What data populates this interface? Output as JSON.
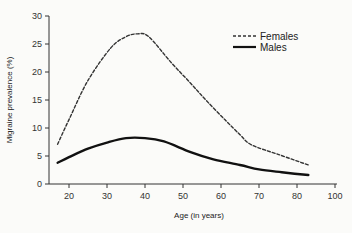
{
  "chart_data": {
    "type": "line",
    "title": "",
    "xlabel": "Age (in years)",
    "ylabel": "Migraine prevalence (%)",
    "xlim": [
      15,
      92
    ],
    "ylim": [
      0,
      30
    ],
    "grid": false,
    "legend_position": "upper right",
    "x_ticks": [
      {
        "pos": 20,
        "label": "20"
      },
      {
        "pos": 30,
        "label": "30"
      },
      {
        "pos": 40,
        "label": "40"
      },
      {
        "pos": 50,
        "label": "50"
      },
      {
        "pos": 60,
        "label": "60"
      },
      {
        "pos": 70,
        "label": "70"
      },
      {
        "pos": 80,
        "label": "80"
      },
      {
        "pos": 90,
        "label": "100"
      }
    ],
    "y_ticks": [
      0,
      5,
      10,
      15,
      20,
      25,
      30
    ],
    "series": [
      {
        "name": "Females",
        "style": "dashed",
        "color": "#333333",
        "x": [
          17,
          20,
          25,
          31,
          35,
          38,
          41,
          47,
          52,
          56,
          61,
          65,
          68,
          75,
          83
        ],
        "values": [
          7.1,
          11.5,
          18.5,
          24.3,
          26.3,
          26.8,
          26.3,
          21.6,
          18.0,
          15.0,
          11.5,
          8.8,
          7.0,
          5.3,
          3.4
        ]
      },
      {
        "name": "Males",
        "style": "solid",
        "color": "#111111",
        "x": [
          17,
          20,
          25,
          30,
          35,
          40,
          45,
          52,
          58,
          65,
          70,
          76,
          83
        ],
        "values": [
          3.8,
          4.8,
          6.3,
          7.4,
          8.2,
          8.2,
          7.6,
          5.7,
          4.4,
          3.4,
          2.6,
          2.1,
          1.6
        ]
      }
    ]
  },
  "legend": {
    "females_label": "Females",
    "males_label": "Males"
  }
}
